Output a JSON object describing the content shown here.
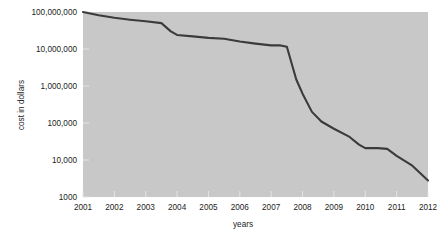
{
  "chart_data": {
    "type": "line",
    "title": "",
    "xlabel": "years",
    "ylabel": "cost in dollars",
    "yscale": "log",
    "ylim": [
      1000,
      100000000
    ],
    "xlim": [
      2001,
      2012
    ],
    "grid": false,
    "legend": null,
    "y_tick_labels": [
      "100,000,000",
      "10,000,000",
      "1,000,000",
      "100,000",
      "10,000",
      "1000"
    ],
    "y_tick_values": [
      100000000,
      10000000,
      1000000,
      100000,
      10000,
      1000
    ],
    "x_tick_labels": [
      "2001",
      "2002",
      "2003",
      "2004",
      "2005",
      "2006",
      "2007",
      "2008",
      "2009",
      "2010",
      "2011",
      "2012"
    ],
    "x_tick_values": [
      2001,
      2002,
      2003,
      2004,
      2005,
      2006,
      2007,
      2008,
      2009,
      2010,
      2011,
      2012
    ],
    "series": [
      {
        "name": "cost in dollars",
        "color": "#3b3b3b",
        "x": [
          2001.0,
          2001.5,
          2002.0,
          2002.5,
          2003.0,
          2003.5,
          2003.8,
          2004.0,
          2004.5,
          2005.0,
          2005.5,
          2006.0,
          2006.5,
          2007.0,
          2007.3,
          2007.5,
          2007.8,
          2008.0,
          2008.3,
          2008.6,
          2009.0,
          2009.5,
          2009.8,
          2010.0,
          2010.4,
          2010.7,
          2011.0,
          2011.5,
          2012.0
        ],
        "values": [
          100000000,
          82000000,
          70000000,
          62000000,
          56000000,
          50000000,
          30000000,
          24000000,
          22000000,
          20000000,
          19000000,
          16000000,
          14000000,
          12500000,
          12500000,
          11500000,
          1500000,
          620000,
          200000,
          110000,
          70000,
          42000,
          26000,
          21000,
          21000,
          20000,
          13000,
          7000,
          2800
        ]
      }
    ]
  },
  "plot_area": {
    "left": 83,
    "top": 12,
    "right": 428,
    "bottom": 197,
    "background_color": "#c8c8c8",
    "page_background_color": "#ffffff",
    "tick_color": "#e4e4e4"
  }
}
